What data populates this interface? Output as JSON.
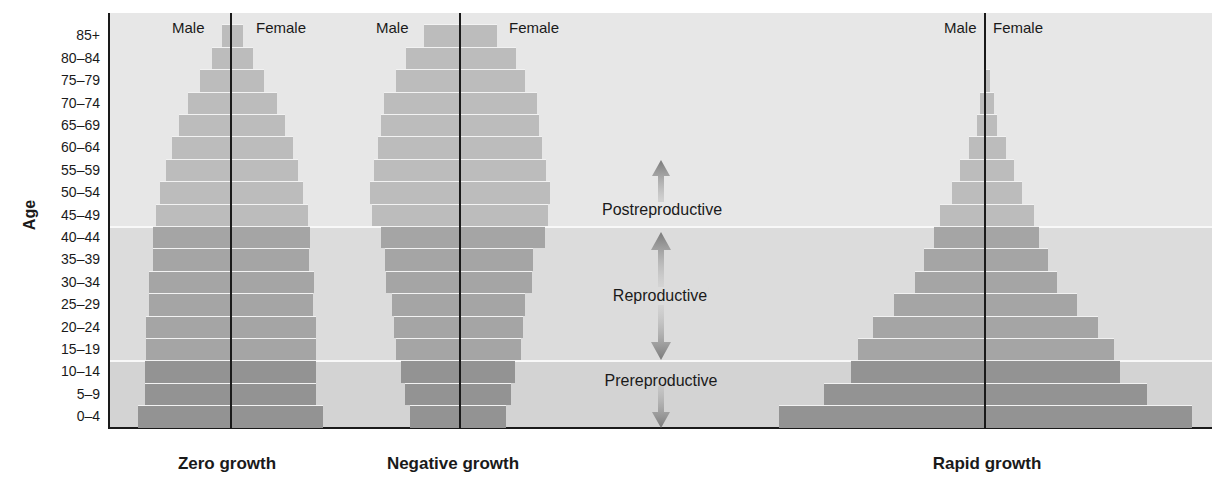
{
  "figure": {
    "title_visible": "",
    "y_axis_label": "Age",
    "sex_labels": {
      "male": "Male",
      "female": "Female"
    },
    "stage_labels": {
      "post": "Postreproductive",
      "repro": "Reproductive",
      "pre": "Prereproductive"
    },
    "colors": {
      "band_post": "#e7e7e7",
      "band_repro": "#dcdcdc",
      "band_pre": "#d3d3d3",
      "bar_post": "#bcbcbc",
      "bar_repro": "#a5a5a5",
      "bar_pre": "#939393",
      "arrow": "#808080",
      "axis": "#1a1a1a"
    }
  },
  "chart_data": {
    "type": "bar",
    "subtype": "population-pyramid",
    "title": "",
    "xlabel": "",
    "ylabel": "Age",
    "categories": [
      "85+",
      "80–84",
      "75–79",
      "70–74",
      "65–69",
      "60–64",
      "55–59",
      "50–54",
      "45–49",
      "40–44",
      "35–39",
      "30–34",
      "25–29",
      "20–24",
      "15–19",
      "10–14",
      "5–9",
      "0–4"
    ],
    "category_groups": [
      {
        "name": "Postreproductive",
        "range": [
          "85+",
          "45–49"
        ]
      },
      {
        "name": "Reproductive",
        "range": [
          "40–44",
          "15–19"
        ]
      },
      {
        "name": "Prereproductive",
        "range": [
          "10–14",
          "0–4"
        ]
      }
    ],
    "units": "relative bar half-width (px, male = female, symmetric)",
    "grid": false,
    "legend": {
      "entries": [
        "Male",
        "Female"
      ],
      "position": "top of each pyramid"
    },
    "pyramids": [
      {
        "name": "Zero growth",
        "center_x": 231,
        "male": [
          9,
          19,
          31,
          43,
          52,
          59,
          65,
          71,
          75,
          78,
          78,
          82,
          82,
          85,
          85,
          86,
          86,
          93
        ],
        "female": [
          12,
          22,
          33,
          46,
          54,
          62,
          67,
          72,
          77,
          79,
          78,
          83,
          82,
          85,
          85,
          85,
          85,
          92
        ]
      },
      {
        "name": "Negative growth",
        "center_x": 460,
        "male": [
          36,
          54,
          64,
          76,
          79,
          82,
          86,
          90,
          88,
          79,
          75,
          74,
          68,
          66,
          64,
          59,
          55,
          50
        ],
        "female": [
          37,
          56,
          65,
          77,
          79,
          82,
          86,
          90,
          88,
          85,
          73,
          72,
          65,
          63,
          61,
          55,
          51,
          46
        ]
      },
      {
        "name": "Rapid growth",
        "center_x": 985,
        "male": [
          0,
          0,
          1,
          5,
          8,
          16,
          25,
          33,
          45,
          51,
          61,
          70,
          91,
          112,
          127,
          134,
          161,
          206
        ],
        "female": [
          0,
          0,
          5,
          9,
          12,
          21,
          29,
          37,
          49,
          54,
          63,
          72,
          92,
          113,
          129,
          135,
          162,
          207
        ]
      }
    ]
  }
}
